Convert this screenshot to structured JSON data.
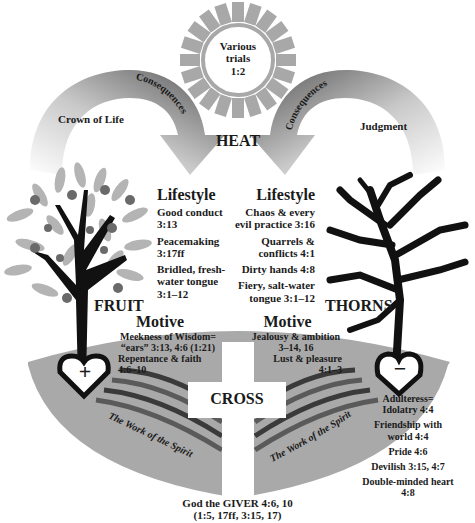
{
  "colors": {
    "sun_ray": "#a8a8a8",
    "arrow_dark": "#585858",
    "arrow_light": "#c8c8c8",
    "bowl_gray": "#a9a9a9",
    "stripe_dark": "#3a3a3a",
    "stripe_mid": "#6e6e6e",
    "tree_black": "#111111",
    "leaf_gray": "#b4b4b4",
    "fruit_gray": "#6a6a6a"
  },
  "sun": {
    "text_line1": "Various",
    "text_line2": "trials",
    "text_line3": "1:2",
    "label": "HEAT"
  },
  "left_arrow": {
    "curve_label": "Consequences",
    "inner_label": "Crown of Life"
  },
  "right_arrow": {
    "curve_label": "Consequences",
    "inner_label": "Judgment"
  },
  "left_tree": {
    "label": "FRUIT",
    "heart_symbol": "+"
  },
  "right_tree": {
    "label": "THORNS",
    "heart_symbol": "−"
  },
  "left_lifestyle": {
    "heading": "Lifestyle",
    "items": [
      "Good conduct 3:13",
      "Peacemaking 3:17ff",
      "Bridled, fresh-water tongue 3:1–12"
    ],
    "lines": [
      [
        "Good conduct",
        "3:13"
      ],
      [
        "Peacemaking",
        "3:17ff"
      ],
      [
        "Bridled, fresh-",
        "water tongue",
        "3:1–12"
      ]
    ]
  },
  "right_lifestyle": {
    "heading": "Lifestyle",
    "lines": [
      [
        "Chaos & every",
        "evil practice 3:16"
      ],
      [
        "Quarrels &",
        "conflicts 4:1"
      ],
      [
        "Dirty hands 4:8"
      ],
      [
        "Fiery, salt-water",
        "tongue 3:1–12"
      ]
    ]
  },
  "left_motive": {
    "heading": "Motive",
    "lines": [
      "Meekness of Wisdom=",
      "“ears” 3:13, 4:6 (1:21)",
      "Repentance & faith",
      "4:6–10"
    ]
  },
  "right_motive": {
    "heading": "Motive",
    "lines": [
      "Jealousy & ambition",
      "3–14, 16",
      "Lust & pleasure",
      "4:1–3"
    ]
  },
  "cross": {
    "label": "CROSS"
  },
  "spirit": {
    "left_label": "The Work of the Spirit",
    "right_label": "The Work of the Spirit"
  },
  "right_list": {
    "lines": [
      [
        "Adulteress=",
        "Idolatry 4:4"
      ],
      [
        "Friendship with",
        "world 4:4"
      ],
      [
        "Pride 4:6"
      ],
      [
        "Devilish 3:15, 4:7"
      ],
      [
        "Double-minded heart",
        "4:8"
      ]
    ]
  },
  "footer": {
    "line1": "God the GIVER 4:6, 10",
    "line2": "(1:5, 17ff, 3:15, 17)"
  }
}
